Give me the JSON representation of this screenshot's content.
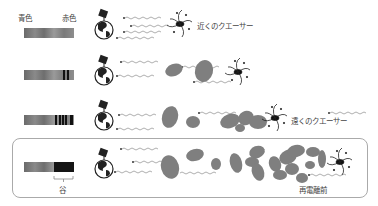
{
  "diagram": {
    "spectrum_axis": {
      "blue_label": "青色",
      "red_label": "赤色"
    },
    "rows": [
      {
        "id": "near",
        "label": "近くのクエーサー",
        "cloud_count": 0,
        "absorption_lines": []
      },
      {
        "id": "mid",
        "label": "",
        "cloud_count": 2,
        "absorption_lines": [
          0.78,
          0.84
        ]
      },
      {
        "id": "far",
        "label": "遠くのクエーサー",
        "cloud_count": 6,
        "absorption_lines": [
          0.62,
          0.7,
          0.76,
          0.82,
          0.92
        ]
      },
      {
        "id": "reionization",
        "label": "再電離前",
        "cloud_count": 20,
        "trough_label": "谷",
        "highlighted": true
      }
    ],
    "colors": {
      "cloud": "#7f7f7f",
      "spectrum_dark": "#111111",
      "frame": "#aaaaaa"
    },
    "icons": [
      "earth-with-dish-icon",
      "quasar-icon",
      "light-ray-icon",
      "gas-cloud-icon"
    ]
  }
}
